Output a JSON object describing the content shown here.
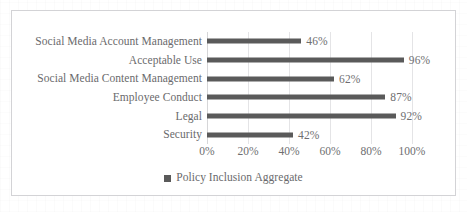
{
  "chart_data": {
    "type": "bar",
    "orientation": "horizontal",
    "title": "",
    "xlabel": "",
    "ylabel": "",
    "xlim": [
      0,
      100
    ],
    "xticks": [
      "0%",
      "20%",
      "40%",
      "60%",
      "80%",
      "100%"
    ],
    "grid": true,
    "legend_position": "bottom",
    "categories": [
      "Social Media Account Management",
      "Acceptable Use",
      "Social Media Content Management",
      "Employee Conduct",
      "Legal",
      "Security"
    ],
    "values": [
      46,
      96,
      62,
      87,
      92,
      42
    ],
    "data_labels": [
      "46%",
      "96%",
      "62%",
      "87%",
      "92%",
      "42%"
    ],
    "series": [
      {
        "name": "Policy Inclusion Aggregate",
        "values": [
          46,
          96,
          62,
          87,
          92,
          42
        ],
        "color": "#5a5a5a"
      }
    ]
  },
  "legend": {
    "marker_name": "legend-square-marker",
    "label": "Policy Inclusion Aggregate",
    "color": "#5a5a5a"
  },
  "colors": {
    "bar": "#5a5a5a",
    "text": "#6a6a6c",
    "gridline": "#e4e4e6",
    "border": "#d3d3d6",
    "background": "#ffffff"
  }
}
